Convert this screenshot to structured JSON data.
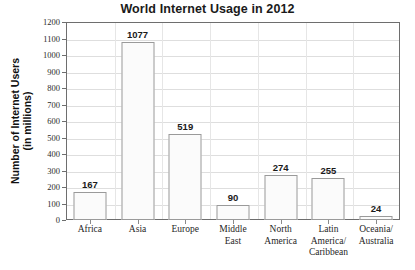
{
  "chart_data": {
    "type": "bar",
    "title": "World Internet Usage in 2012",
    "xlabel": "",
    "ylabel": "Number of Internet Users (in millions)",
    "ylabel_lines": [
      "Number of Internet Users",
      "(in millions)"
    ],
    "categories": [
      "Africa",
      "Asia",
      "Europe",
      "Middle East",
      "North America",
      "Latin America/ Caribbean",
      "Oceania/ Australia"
    ],
    "category_lines": [
      [
        "Africa"
      ],
      [
        "Asia"
      ],
      [
        "Europe"
      ],
      [
        "Middle",
        "East"
      ],
      [
        "North",
        "America"
      ],
      [
        "Latin",
        "America/",
        "Caribbean"
      ],
      [
        "Oceania/",
        "Australia"
      ]
    ],
    "values": [
      167,
      1077,
      519,
      90,
      274,
      255,
      24
    ],
    "value_labels": [
      "167",
      "1077",
      "519",
      "90",
      "274",
      "255",
      "24"
    ],
    "ylim": [
      0,
      1200
    ],
    "ytick_step": 100,
    "ytick_labels": [
      "1200",
      "1100",
      "1000",
      "900",
      "800",
      "700",
      "600",
      "500",
      "400",
      "300",
      "200",
      "100",
      "0"
    ],
    "grid": "horizontal-and-category-dividers",
    "legend": "none",
    "bar_fill": "#fbfbfb",
    "bar_border": "#9a9a9a",
    "frame_color": "#6e6e6e",
    "gridline_color": "#dedede",
    "text_color": "#1a1a1a"
  }
}
